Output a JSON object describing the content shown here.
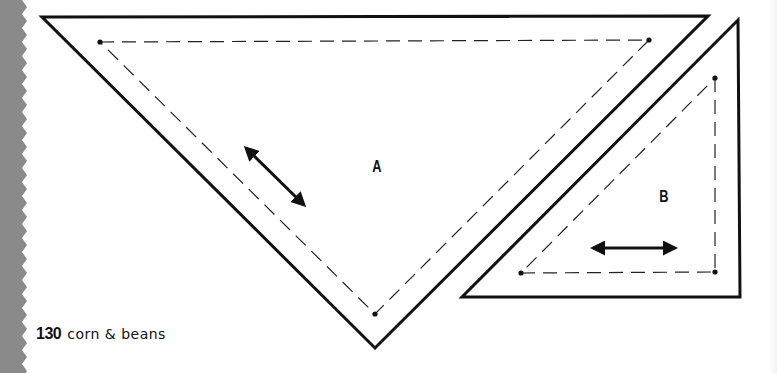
{
  "page": {
    "number": "130",
    "book_title": "corn & beans",
    "edge_color": "#8a8a8a",
    "line_color": "#111111"
  },
  "templates": [
    {
      "id": "A",
      "label": "A",
      "shape": "triangle",
      "outer_points": [
        [
          42,
          17
        ],
        [
          708,
          16
        ],
        [
          375,
          348
        ]
      ],
      "seam_points": [
        [
          100,
          42
        ],
        [
          649,
          40
        ],
        [
          375,
          314
        ]
      ],
      "grain_arrow": [
        [
          246,
          148
        ],
        [
          304,
          205
        ]
      ],
      "label_pos": [
        376,
        168
      ]
    },
    {
      "id": "B",
      "label": "B",
      "shape": "triangle",
      "outer_points": [
        [
          738,
          20
        ],
        [
          740,
          297
        ],
        [
          462,
          297
        ]
      ],
      "seam_points": [
        [
          715,
          78
        ],
        [
          715,
          272
        ],
        [
          521,
          273
        ]
      ],
      "grain_arrow": [
        [
          593,
          248
        ],
        [
          675,
          248
        ]
      ],
      "label_pos": [
        663,
        198
      ]
    }
  ]
}
